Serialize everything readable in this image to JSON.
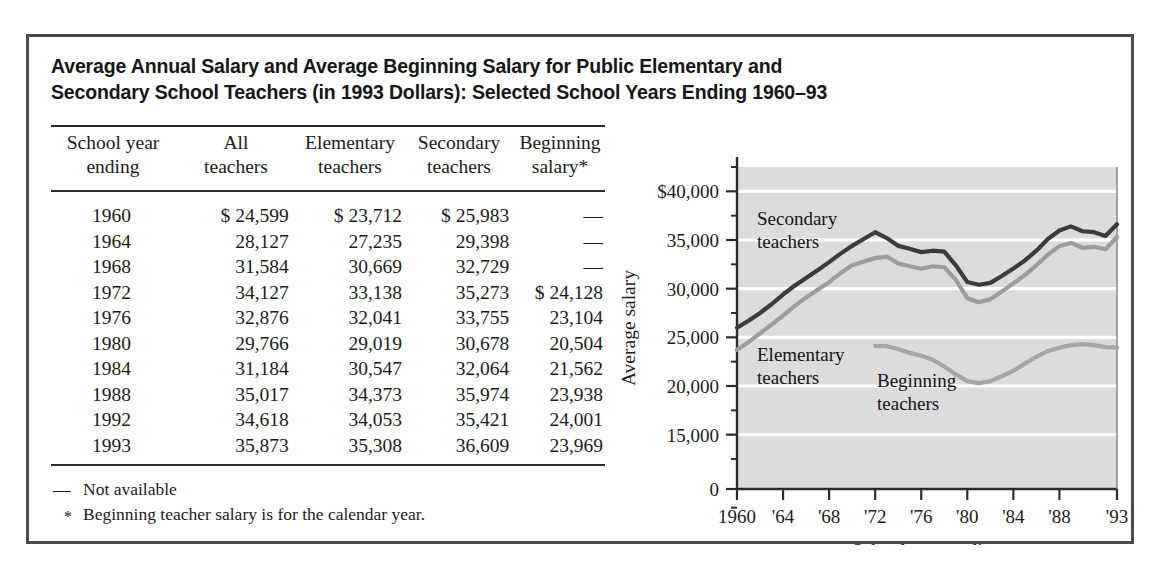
{
  "figure": {
    "title_line1": "Average Annual Salary and Average Beginning Salary for Public Elementary and",
    "title_line2": "Secondary School Teachers (in 1993 Dollars): Selected School Years Ending 1960–93"
  },
  "table": {
    "headers": [
      {
        "line1": "School year",
        "line2": "ending"
      },
      {
        "line1": "All",
        "line2": "teachers"
      },
      {
        "line1": "Elementary",
        "line2": "teachers"
      },
      {
        "line1": "Secondary",
        "line2": "teachers"
      },
      {
        "line1": "Beginning",
        "line2": "salary*"
      }
    ],
    "rows": [
      {
        "year": "1960",
        "all": "$ 24,599",
        "elementary": "$ 23,712",
        "secondary": "$ 25,983",
        "beginning": "—"
      },
      {
        "year": "1964",
        "all": "28,127",
        "elementary": "27,235",
        "secondary": "29,398",
        "beginning": "—"
      },
      {
        "year": "1968",
        "all": "31,584",
        "elementary": "30,669",
        "secondary": "32,729",
        "beginning": "—"
      },
      {
        "year": "1972",
        "all": "34,127",
        "elementary": "33,138",
        "secondary": "35,273",
        "beginning": "$ 24,128"
      },
      {
        "year": "1976",
        "all": "32,876",
        "elementary": "32,041",
        "secondary": "33,755",
        "beginning": "23,104"
      },
      {
        "year": "1980",
        "all": "29,766",
        "elementary": "29,019",
        "secondary": "30,678",
        "beginning": "20,504"
      },
      {
        "year": "1984",
        "all": "31,184",
        "elementary": "30,547",
        "secondary": "32,064",
        "beginning": "21,562"
      },
      {
        "year": "1988",
        "all": "35,017",
        "elementary": "34,373",
        "secondary": "35,974",
        "beginning": "23,938"
      },
      {
        "year": "1992",
        "all": "34,618",
        "elementary": "34,053",
        "secondary": "35,421",
        "beginning": "24,001"
      },
      {
        "year": "1993",
        "all": "35,873",
        "elementary": "35,308",
        "secondary": "36,609",
        "beginning": "23,969"
      }
    ]
  },
  "footnotes": [
    {
      "mark": "—",
      "text": "Not available"
    },
    {
      "mark": "*",
      "text": "Beginning teacher salary is for the calendar year."
    }
  ],
  "chart_data": {
    "type": "line",
    "title": "",
    "xlabel": "School year ending",
    "ylabel": "Average salary",
    "grid": true,
    "legend_position": "inline-annotations",
    "plot_background": "#dcdcdc",
    "gridline_color": "#ffffff",
    "axis_break": true,
    "ylim": [
      0,
      42500
    ],
    "ytick_labels": [
      "$40,000",
      "35,000",
      "30,000",
      "25,000",
      "20,000",
      "15,000",
      "0"
    ],
    "ytick_values": [
      40000,
      35000,
      30000,
      25000,
      20000,
      15000,
      0
    ],
    "yminor_values": [
      42500,
      37500,
      32500,
      27500,
      22500,
      17500,
      12500,
      7500
    ],
    "xtick_labels": [
      "1960",
      "'64",
      "'68",
      "'72",
      "'76",
      "'80",
      "'84",
      "'88",
      "'93"
    ],
    "xtick_values": [
      1960,
      1964,
      1968,
      1972,
      1976,
      1980,
      1984,
      1988,
      1993
    ],
    "xlim": [
      1960,
      1993
    ],
    "series": [
      {
        "name": "Secondary teachers",
        "color": "#3c3c3c",
        "label_line1": "Secondary",
        "label_line2": "teachers",
        "x": [
          1960,
          1961,
          1962,
          1963,
          1964,
          1965,
          1966,
          1967,
          1968,
          1969,
          1970,
          1971,
          1972,
          1973,
          1974,
          1975,
          1976,
          1977,
          1978,
          1979,
          1980,
          1981,
          1982,
          1983,
          1984,
          1985,
          1986,
          1987,
          1988,
          1989,
          1990,
          1991,
          1992,
          1993
        ],
        "y": [
          25983,
          26700,
          27500,
          28400,
          29398,
          30300,
          31100,
          31900,
          32729,
          33600,
          34400,
          35100,
          35800,
          35200,
          34400,
          34100,
          33755,
          33900,
          33800,
          32400,
          30678,
          30400,
          30600,
          31300,
          32064,
          32900,
          33900,
          35100,
          35974,
          36400,
          35900,
          35800,
          35421,
          36609
        ]
      },
      {
        "name": "Elementary teachers",
        "color": "#9c9c9c",
        "label_line1": "Elementary",
        "label_line2": "teachers",
        "x": [
          1960,
          1961,
          1962,
          1963,
          1964,
          1965,
          1966,
          1967,
          1968,
          1969,
          1970,
          1971,
          1972,
          1973,
          1974,
          1975,
          1976,
          1977,
          1978,
          1979,
          1980,
          1981,
          1982,
          1983,
          1984,
          1985,
          1986,
          1987,
          1988,
          1989,
          1990,
          1991,
          1992,
          1993
        ],
        "y": [
          23712,
          24500,
          25400,
          26300,
          27235,
          28200,
          29100,
          29900,
          30669,
          31600,
          32400,
          32800,
          33138,
          33300,
          32600,
          32300,
          32041,
          32300,
          32200,
          30900,
          29019,
          28600,
          28900,
          29700,
          30547,
          31400,
          32400,
          33500,
          34373,
          34700,
          34200,
          34300,
          34053,
          35308
        ]
      },
      {
        "name": "Beginning teachers",
        "color": "#a5a5a5",
        "label_line1": "Beginning",
        "label_line2": "teachers",
        "x": [
          1972,
          1973,
          1974,
          1975,
          1976,
          1977,
          1978,
          1979,
          1980,
          1981,
          1982,
          1983,
          1984,
          1985,
          1986,
          1987,
          1988,
          1989,
          1990,
          1991,
          1992,
          1993
        ],
        "y": [
          24128,
          24100,
          23800,
          23400,
          23104,
          22700,
          22000,
          21200,
          20504,
          20300,
          20500,
          21000,
          21562,
          22300,
          23000,
          23600,
          23938,
          24200,
          24300,
          24200,
          24001,
          23969
        ]
      }
    ]
  }
}
